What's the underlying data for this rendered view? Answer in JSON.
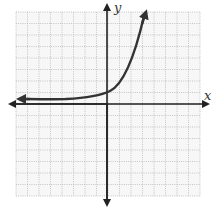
{
  "chart_data": {
    "type": "line",
    "title": "",
    "xlabel": "x",
    "ylabel": "y",
    "grid": true,
    "grid_squares_x": 16,
    "grid_squares_y": 16,
    "xlim": [
      -8,
      8
    ],
    "ylim": [
      -8,
      8
    ],
    "asymptote_y": 0.5,
    "y_intercept": 1,
    "points": [
      {
        "x": -8,
        "y": 0.5
      },
      {
        "x": -4,
        "y": 0.55
      },
      {
        "x": -2,
        "y": 0.7
      },
      {
        "x": 0,
        "y": 1.1
      },
      {
        "x": 1,
        "y": 2
      },
      {
        "x": 2,
        "y": 4
      },
      {
        "x": 3,
        "y": 7
      },
      {
        "x": 3.4,
        "y": 8
      }
    ],
    "arrows": [
      "left",
      "up"
    ],
    "tick_labels": []
  },
  "labels": {
    "x_axis": "x",
    "y_axis": "y"
  },
  "colors": {
    "grid": "#b8b8b8",
    "axis": "#222222",
    "curve": "#333333",
    "background": "#f7f7f7"
  }
}
